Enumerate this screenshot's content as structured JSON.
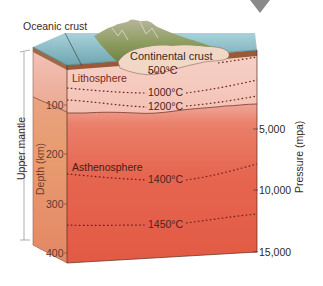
{
  "diagram": {
    "layers": {
      "oceanic_crust": "Oceanic crust",
      "continental_crust": "Continental crust",
      "lithosphere": "Lithosphere",
      "asthenosphere": "Asthenosphere"
    },
    "bracket_label": "Upper mantle",
    "depth_axis": {
      "label": "Depth (km)",
      "ticks": [
        "100",
        "200",
        "300",
        "400"
      ]
    },
    "pressure_axis": {
      "label": "Pressure (mpa)",
      "ticks": [
        "5,000",
        "10,000",
        "15,000"
      ]
    },
    "isotherms": [
      "500°C",
      "1000°C",
      "1200°C",
      "1400°C",
      "1450°C"
    ],
    "colors": {
      "ocean": "#7fb3bd",
      "ocean_dark": "#5e98a3",
      "continental_crust": "#f0d6c4",
      "lithosphere_top": "#f4c9c0",
      "lithosphere_bottom": "#ec9e90",
      "asthenosphere": "#e6604a",
      "side_face": "#e89080",
      "side_orange": "#e8a070",
      "isotherm": "#6a2018",
      "marker": "#8a8a8a"
    }
  }
}
